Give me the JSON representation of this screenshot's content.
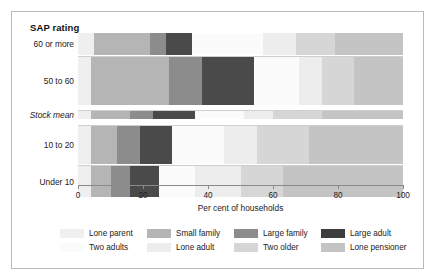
{
  "figure": {
    "title": "SAP rating",
    "xaxis_title": "Per cent of households"
  },
  "chart_data": {
    "type": "bar",
    "orientation": "horizontal",
    "stacked": true,
    "normalized_percent": true,
    "title": "SAP rating",
    "xlabel": "Per cent of households",
    "ylabel": "SAP rating",
    "xlim": [
      0,
      100
    ],
    "xticks": [
      0,
      20,
      40,
      60,
      80,
      100
    ],
    "xtick_labels": [
      "0",
      "20",
      "40",
      "60",
      "80",
      "100"
    ],
    "grid": false,
    "legend_position": "bottom",
    "categories": [
      "60 or more",
      "50 to 60",
      "Stock mean",
      "10 to 20",
      "Under 10"
    ],
    "category_styles": [
      "normal",
      "normal",
      "italic",
      "normal",
      "normal"
    ],
    "series": [
      {
        "name": "Lone parent",
        "color": "#efefef",
        "values": [
          5,
          4,
          4,
          4,
          4
        ]
      },
      {
        "name": "Small family",
        "color": "#b5b5b5",
        "values": [
          17,
          24,
          12,
          8,
          6
        ]
      },
      {
        "name": "Large family",
        "color": "#8c8c8c",
        "values": [
          5,
          10,
          7,
          7,
          6
        ]
      },
      {
        "name": "Large adult",
        "color": "#4a4a4a",
        "values": [
          8,
          16,
          13,
          10,
          9
        ]
      },
      {
        "name": "Two adults",
        "color": "#fbfbfb",
        "values": [
          22,
          14,
          15,
          16,
          11
        ]
      },
      {
        "name": "Lone adult",
        "color": "#ededed",
        "values": [
          10,
          7,
          9,
          10,
          14
        ]
      },
      {
        "name": "Two older",
        "color": "#d6d6d6",
        "values": [
          12,
          10,
          15,
          16,
          13
        ]
      },
      {
        "name": "Lone pensioner",
        "color": "#c4c4c4",
        "values": [
          21,
          15,
          25,
          29,
          37
        ]
      }
    ]
  },
  "legend": {
    "row1": [
      {
        "label": "Lone parent",
        "color": "#efefef"
      },
      {
        "label": "Small family",
        "color": "#b5b5b5"
      },
      {
        "label": "Large family",
        "color": "#8c8c8c"
      },
      {
        "label": "Large adult",
        "color": "#3d3d3d"
      }
    ],
    "row2": [
      {
        "label": "Two adults",
        "color": "#fbfbfb"
      },
      {
        "label": "Lone adult",
        "color": "#ededed"
      },
      {
        "label": "Two older",
        "color": "#d6d6d6"
      },
      {
        "label": "Lone pensioner",
        "color": "#c4c4c4"
      }
    ]
  }
}
